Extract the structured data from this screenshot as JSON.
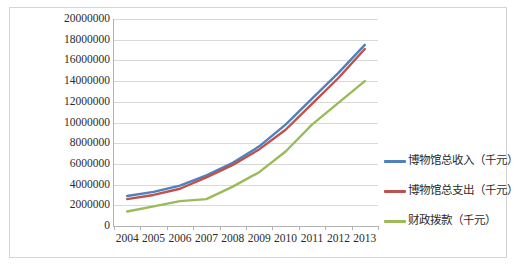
{
  "chart_data": {
    "type": "line",
    "title": "",
    "xlabel": "",
    "ylabel": "",
    "x": [
      "2004",
      "2005",
      "2006",
      "2007",
      "2008",
      "2009",
      "2010",
      "2011",
      "2012",
      "2013"
    ],
    "ylim": [
      0,
      20000000
    ],
    "ytick_step": 2000000,
    "yticks": [
      "20000000",
      "18000000",
      "16000000",
      "14000000",
      "12000000",
      "10000000",
      "8000000",
      "6000000",
      "4000000",
      "2000000",
      "0"
    ],
    "grid": "horizontal",
    "legend_position": "right",
    "series": [
      {
        "name": "博物馆总收入（千元）",
        "color": "#4F81BD",
        "values": [
          2900000,
          3300000,
          3900000,
          4900000,
          6100000,
          7700000,
          9800000,
          12300000,
          14800000,
          17500000
        ]
      },
      {
        "name": "博物馆总支出（千元）",
        "color": "#C0504D",
        "values": [
          2600000,
          3000000,
          3600000,
          4700000,
          5900000,
          7400000,
          9300000,
          11800000,
          14300000,
          17100000
        ]
      },
      {
        "name": "财政拨款（千元）",
        "color": "#9BBB59",
        "values": [
          1400000,
          1900000,
          2400000,
          2600000,
          3800000,
          5200000,
          7200000,
          9800000,
          11900000,
          14000000
        ]
      }
    ]
  },
  "legend": {
    "items": [
      {
        "label": "博物馆总收入（千元）",
        "color": "#4F81BD"
      },
      {
        "label": "博物馆总支出（千元）",
        "color": "#C0504D"
      },
      {
        "label": "财政拨款（千元）",
        "color": "#9BBB59"
      }
    ]
  },
  "colors": {
    "gridline": "#D9D9D9",
    "axis": "#B3B3B3",
    "border": "#D4D4D4",
    "text": "#2B2B2B",
    "background": "#FFFFFF"
  }
}
